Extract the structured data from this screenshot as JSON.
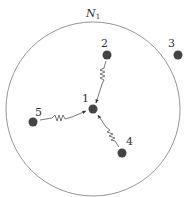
{
  "diagram": {
    "neighborhood": {
      "label": "N",
      "subscript": "1",
      "center": [
        93,
        109
      ],
      "radius": 87,
      "stroke": "#8a8a8a"
    },
    "nodes": [
      {
        "id": "1",
        "label": "1",
        "x": 93,
        "y": 109,
        "label_x": 84,
        "label_y": 102
      },
      {
        "id": "2",
        "label": "2",
        "x": 107,
        "y": 55,
        "label_x": 100,
        "label_y": 48
      },
      {
        "id": "3",
        "label": "3",
        "x": 178,
        "y": 55,
        "label_x": 168,
        "label_y": 48
      },
      {
        "id": "4",
        "label": "4",
        "x": 122,
        "y": 153,
        "label_x": 126,
        "label_y": 145
      },
      {
        "id": "5",
        "label": "5",
        "x": 33,
        "y": 122,
        "label_x": 36,
        "label_y": 116
      }
    ],
    "springs": [
      {
        "from": "2",
        "to": "1",
        "type": "spring-arrow"
      },
      {
        "from": "5",
        "to": "1",
        "type": "spring-arrow"
      },
      {
        "from": "4",
        "to": "1",
        "type": "spring-arrow"
      }
    ],
    "colors": {
      "node": "#444444",
      "edge": "#555555",
      "text": "#333333"
    }
  }
}
